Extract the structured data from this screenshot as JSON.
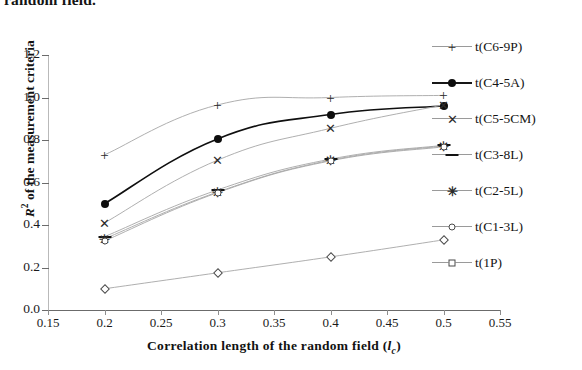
{
  "caption_fragment": "random field.",
  "chart_data": {
    "type": "line",
    "title": "",
    "xlabel": "Correlation length of the random field (lc)",
    "ylabel": "R2 of the measurement criteria",
    "xlabel_parts": {
      "main": "Correlation length of the random field (",
      "italic": "l",
      "sub": "c",
      "tail": ")"
    },
    "ylabel_parts": {
      "italic": "R",
      "sup": "2",
      "tail": " of the measurement criteria"
    },
    "x": [
      0.2,
      0.3,
      0.4,
      0.5
    ],
    "xlim": [
      0.15,
      0.55
    ],
    "ylim": [
      0.0,
      1.2
    ],
    "xticks": [
      "0.15",
      "0.2",
      "0.25",
      "0.3",
      "0.35",
      "0.4",
      "0.45",
      "0.5",
      "0.55"
    ],
    "xtick_values": [
      0.15,
      0.2,
      0.25,
      0.3,
      0.35,
      0.4,
      0.45,
      0.5,
      0.55
    ],
    "yticks": [
      "0.0",
      "0.2",
      "0.4",
      "0.6",
      "0.8",
      "1.0",
      "1.2"
    ],
    "ytick_values": [
      0.0,
      0.2,
      0.4,
      0.6,
      0.8,
      1.0,
      1.2
    ],
    "grid": false,
    "legend_position": "right",
    "series": [
      {
        "name": "t(C6-9P)",
        "marker": "plus",
        "values": [
          0.73,
          0.965,
          1.0,
          1.01
        ]
      },
      {
        "name": "t(C4-5A)",
        "marker": "dot",
        "values": [
          0.5,
          0.805,
          0.92,
          0.96
        ]
      },
      {
        "name": "t(C5-5CM)",
        "marker": "cross",
        "values": [
          0.41,
          0.705,
          0.855,
          0.965
        ]
      },
      {
        "name": "t(C3-8L)",
        "marker": "dash",
        "values": [
          0.345,
          0.565,
          0.71,
          0.775
        ]
      },
      {
        "name": "t(C2-5L)",
        "marker": "star",
        "values": [
          0.335,
          0.555,
          0.705,
          0.772
        ]
      },
      {
        "name": "t(C1-3L)",
        "marker": "circle",
        "values": [
          0.325,
          0.552,
          0.702,
          0.768
        ]
      },
      {
        "name": "t(1P)",
        "marker": "diamond",
        "values": [
          0.1,
          0.175,
          0.25,
          0.33
        ]
      }
    ]
  }
}
